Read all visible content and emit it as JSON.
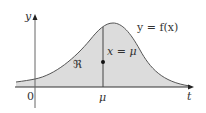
{
  "figure": {
    "type": "function-graph",
    "region_fill": "#dcdcdc",
    "curve_color": "#555555",
    "axis_color": "#333333",
    "labels": {
      "y_axis": "y",
      "x_axis": "t",
      "origin": "0",
      "mu_tick": "μ",
      "curve": "y = f(x)",
      "vertical_line": "x = μ",
      "region": "ℜ"
    }
  }
}
